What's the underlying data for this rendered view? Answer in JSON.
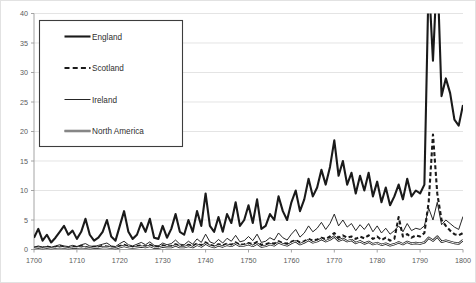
{
  "chart_data": {
    "type": "line",
    "title": "",
    "subtitle": "",
    "xlabel": "",
    "ylabel": "",
    "xlim": [
      1700,
      1800
    ],
    "ylim": [
      0,
      40
    ],
    "grid": true,
    "grid_axis": "y",
    "legend_position": "top-left-inside",
    "x_ticks": [
      1700,
      1710,
      1720,
      1730,
      1740,
      1750,
      1760,
      1770,
      1780,
      1790,
      1800
    ],
    "y_ticks": [
      0,
      5,
      10,
      15,
      20,
      25,
      30,
      35,
      40
    ],
    "x_tick_labels": [
      "1700",
      "1710",
      "1720",
      "1730",
      "1740",
      "1750",
      "1760",
      "1770",
      "1780",
      "1790",
      "1800"
    ],
    "y_tick_labels": [
      "0",
      "5",
      "10",
      "15",
      "20",
      "25",
      "30",
      "35",
      "40"
    ],
    "note": "England series exceeds the 40 axis maximum in 1792 and 1794; lines are clipped at the plot top.",
    "x": [
      1700,
      1701,
      1702,
      1703,
      1704,
      1705,
      1706,
      1707,
      1708,
      1709,
      1710,
      1711,
      1712,
      1713,
      1714,
      1715,
      1716,
      1717,
      1718,
      1719,
      1720,
      1721,
      1722,
      1723,
      1724,
      1725,
      1726,
      1727,
      1728,
      1729,
      1730,
      1731,
      1732,
      1733,
      1734,
      1735,
      1736,
      1737,
      1738,
      1739,
      1740,
      1741,
      1742,
      1743,
      1744,
      1745,
      1746,
      1747,
      1748,
      1749,
      1750,
      1751,
      1752,
      1753,
      1754,
      1755,
      1756,
      1757,
      1758,
      1759,
      1760,
      1761,
      1762,
      1763,
      1764,
      1765,
      1766,
      1767,
      1768,
      1769,
      1770,
      1771,
      1772,
      1773,
      1774,
      1775,
      1776,
      1777,
      1778,
      1779,
      1780,
      1781,
      1782,
      1783,
      1784,
      1785,
      1786,
      1787,
      1788,
      1789,
      1790,
      1791,
      1792,
      1793,
      1794,
      1795,
      1796,
      1797,
      1798,
      1799,
      1800
    ],
    "series": [
      {
        "name": "England",
        "style": "thick-solid",
        "color": "#1a1a1a",
        "values": [
          2.0,
          3.5,
          1.5,
          2.5,
          1.2,
          2.0,
          3.0,
          4.0,
          2.5,
          3.2,
          1.8,
          3.0,
          5.2,
          2.5,
          1.5,
          2.0,
          3.0,
          5.0,
          2.2,
          1.5,
          4.0,
          6.5,
          3.0,
          1.8,
          2.5,
          4.5,
          3.0,
          5.2,
          2.0,
          1.8,
          4.0,
          2.0,
          3.5,
          6.0,
          3.0,
          2.5,
          5.0,
          3.0,
          6.5,
          4.0,
          9.5,
          4.0,
          3.0,
          5.5,
          3.0,
          6.0,
          4.5,
          8.0,
          4.0,
          5.0,
          7.5,
          4.5,
          8.5,
          3.5,
          4.0,
          6.0,
          5.0,
          9.0,
          6.5,
          5.0,
          8.0,
          10.0,
          6.5,
          8.5,
          12.0,
          9.0,
          10.5,
          13.5,
          11.0,
          14.0,
          18.5,
          12.5,
          15.0,
          11.0,
          13.0,
          9.5,
          12.5,
          10.0,
          13.0,
          9.0,
          11.5,
          8.0,
          10.5,
          7.5,
          9.0,
          11.0,
          8.5,
          12.0,
          9.0,
          10.0,
          9.5,
          11.0,
          46.0,
          32.0,
          48.0,
          26.0,
          29.0,
          26.5,
          22.0,
          21.0,
          24.5
        ]
      },
      {
        "name": "Scotland",
        "style": "thick-dashed",
        "color": "#1a1a1a",
        "values": [
          0.3,
          0.4,
          0.3,
          0.5,
          0.3,
          0.4,
          0.6,
          0.4,
          0.3,
          0.5,
          0.4,
          0.6,
          0.4,
          0.3,
          0.5,
          0.4,
          0.6,
          0.5,
          0.4,
          0.3,
          0.6,
          0.8,
          0.5,
          0.4,
          0.6,
          0.7,
          0.5,
          0.8,
          0.4,
          0.5,
          0.7,
          0.5,
          0.6,
          0.9,
          0.6,
          0.5,
          0.8,
          0.6,
          1.0,
          0.7,
          1.2,
          0.8,
          0.6,
          0.9,
          0.7,
          1.0,
          0.8,
          1.2,
          0.8,
          0.9,
          1.1,
          0.9,
          1.3,
          0.8,
          0.9,
          1.1,
          1.0,
          1.4,
          1.1,
          1.0,
          1.3,
          1.6,
          1.2,
          1.4,
          1.8,
          1.5,
          1.7,
          2.0,
          1.8,
          2.2,
          2.8,
          2.0,
          2.4,
          2.0,
          2.2,
          1.8,
          2.2,
          1.9,
          2.4,
          1.8,
          2.2,
          1.6,
          2.0,
          1.5,
          1.8,
          5.5,
          2.2,
          2.6,
          2.0,
          2.4,
          2.2,
          2.8,
          8.0,
          19.5,
          9.5,
          5.0,
          4.0,
          3.2,
          2.6,
          2.4,
          2.8
        ]
      },
      {
        "name": "Ireland",
        "style": "thin-solid",
        "color": "#1a1a1a",
        "values": [
          0.4,
          0.6,
          0.4,
          0.5,
          0.4,
          0.6,
          0.8,
          0.6,
          0.5,
          0.7,
          0.5,
          0.8,
          1.0,
          0.6,
          0.5,
          0.7,
          0.9,
          1.1,
          0.6,
          0.5,
          1.0,
          1.4,
          0.8,
          0.6,
          0.9,
          1.2,
          0.8,
          1.3,
          0.7,
          0.6,
          1.1,
          0.8,
          1.0,
          1.6,
          0.9,
          0.8,
          1.4,
          0.9,
          1.8,
          1.2,
          2.6,
          1.3,
          1.0,
          1.7,
          1.1,
          1.9,
          1.4,
          2.4,
          1.3,
          1.5,
          2.2,
          1.5,
          2.6,
          1.2,
          1.4,
          2.0,
          1.6,
          2.8,
          2.0,
          1.6,
          2.6,
          3.4,
          2.1,
          2.8,
          4.0,
          3.0,
          3.6,
          4.6,
          3.4,
          4.4,
          6.0,
          4.0,
          5.0,
          3.8,
          4.4,
          3.2,
          4.2,
          3.4,
          4.4,
          3.0,
          4.0,
          2.8,
          3.6,
          2.6,
          3.2,
          4.0,
          3.0,
          4.4,
          3.2,
          3.6,
          3.4,
          4.0,
          7.0,
          5.0,
          8.0,
          4.2,
          5.0,
          4.4,
          3.8,
          3.4,
          5.6
        ]
      },
      {
        "name": "North America",
        "style": "double-line",
        "color": "#1a1a1a",
        "values": [
          0.2,
          0.3,
          0.2,
          0.3,
          0.2,
          0.3,
          0.4,
          0.3,
          0.2,
          0.3,
          0.3,
          0.4,
          0.3,
          0.2,
          0.3,
          0.3,
          0.4,
          0.4,
          0.3,
          0.2,
          0.4,
          0.6,
          0.4,
          0.3,
          0.4,
          0.5,
          0.4,
          0.6,
          0.3,
          0.3,
          0.5,
          0.4,
          0.4,
          0.7,
          0.4,
          0.4,
          0.6,
          0.4,
          0.8,
          0.5,
          1.0,
          0.6,
          0.4,
          0.7,
          0.5,
          0.8,
          0.6,
          1.0,
          0.6,
          0.7,
          0.9,
          0.6,
          1.0,
          0.5,
          0.6,
          0.9,
          0.7,
          1.2,
          0.9,
          0.7,
          1.1,
          1.4,
          0.9,
          1.2,
          1.6,
          1.2,
          1.4,
          1.8,
          1.4,
          1.7,
          2.2,
          1.5,
          1.8,
          1.4,
          1.6,
          1.1,
          1.4,
          1.0,
          1.3,
          0.9,
          1.1,
          0.8,
          1.0,
          0.7,
          0.9,
          1.2,
          0.9,
          1.3,
          1.0,
          1.1,
          1.0,
          1.2,
          2.0,
          1.5,
          2.2,
          1.3,
          1.5,
          1.3,
          1.1,
          1.0,
          1.6
        ]
      }
    ]
  },
  "legend": {
    "entries": [
      {
        "label": "England",
        "style": "thick-solid"
      },
      {
        "label": "Scotland",
        "style": "thick-dashed"
      },
      {
        "label": "Ireland",
        "style": "thin-solid"
      },
      {
        "label": "North America",
        "style": "double-line"
      }
    ]
  }
}
